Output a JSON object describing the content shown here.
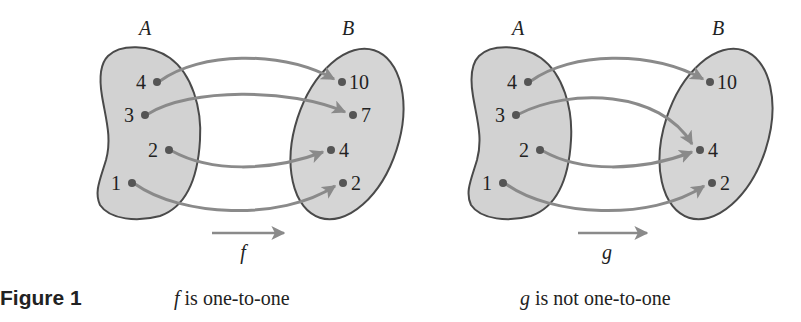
{
  "figure_label": "Figure 1",
  "colors": {
    "blob_fill": "#d2d2d2",
    "blob_stroke": "#4a4a4a",
    "arrow": "#8a8a8a",
    "dot": "#555555",
    "text": "#222222"
  },
  "diagrams": [
    {
      "name": "f",
      "function_label": "f",
      "caption_fn": "f",
      "caption_text": " is one-to-one",
      "domain_label": "A",
      "codomain_label": "B",
      "domain": [
        "4",
        "3",
        "2",
        "1"
      ],
      "codomain": [
        "10",
        "7",
        "4",
        "2"
      ],
      "mapping": [
        {
          "from": "4",
          "to": "10"
        },
        {
          "from": "3",
          "to": "7"
        },
        {
          "from": "2",
          "to": "4"
        },
        {
          "from": "1",
          "to": "2"
        }
      ]
    },
    {
      "name": "g",
      "function_label": "g",
      "caption_fn": "g",
      "caption_text": " is not one-to-one",
      "domain_label": "A",
      "codomain_label": "B",
      "domain": [
        "4",
        "3",
        "2",
        "1"
      ],
      "codomain": [
        "10",
        "4",
        "2"
      ],
      "mapping": [
        {
          "from": "4",
          "to": "10"
        },
        {
          "from": "3",
          "to": "4"
        },
        {
          "from": "2",
          "to": "4"
        },
        {
          "from": "1",
          "to": "2"
        }
      ]
    }
  ]
}
